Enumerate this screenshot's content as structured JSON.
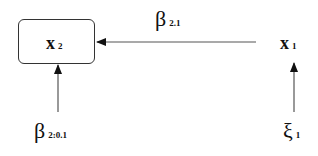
{
  "diagram": {
    "nodes": [
      {
        "id": "x2",
        "symbol": "x",
        "subscript": "2",
        "boxed": true
      },
      {
        "id": "x1",
        "symbol": "x",
        "subscript": "1",
        "boxed": false
      }
    ],
    "edges": [
      {
        "from": "x1",
        "to": "x2",
        "label_symbol": "β",
        "label_subscript": "2.1"
      },
      {
        "from": "beta_2_0_1",
        "to": "x2"
      },
      {
        "from": "xi1",
        "to": "x1"
      }
    ],
    "sources": [
      {
        "id": "beta_2_0_1",
        "symbol": "β",
        "subscript": "2:0.1"
      },
      {
        "id": "xi1",
        "symbol": "ξ",
        "subscript": "1"
      }
    ],
    "colors": {
      "line": "#555555",
      "text": "#111111",
      "background": "#ffffff"
    }
  }
}
